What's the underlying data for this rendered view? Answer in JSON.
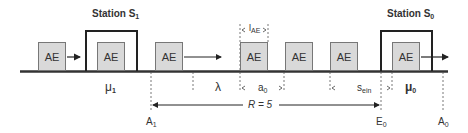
{
  "diagram": {
    "title_left_station": "Station S",
    "title_left_station_sub": "1",
    "title_right_station": "Station S",
    "title_right_station_sub": "0",
    "unit_label": "AE",
    "units": [
      {
        "id": "ae-1",
        "label": "AE",
        "note": "approaching station S1"
      },
      {
        "id": "ae-2",
        "label": "AE",
        "note": "inside station S1"
      },
      {
        "id": "ae-3",
        "label": "AE",
        "note": "departing station S1"
      },
      {
        "id": "ae-4",
        "label": "AE"
      },
      {
        "id": "ae-5",
        "label": "AE"
      },
      {
        "id": "ae-6",
        "label": "AE"
      },
      {
        "id": "ae-7",
        "label": "AE",
        "note": "inside station S0"
      }
    ],
    "labels": {
      "mu1": "μ",
      "mu1_sub": "1",
      "lambda": "λ",
      "l_ae": "l",
      "l_ae_sub": "AE",
      "a0": "a",
      "a0_sub": "0",
      "s_ein": "s",
      "s_ein_sub": "ein",
      "mu0": "μ",
      "mu0_sub": "0",
      "r_label": "R = 5",
      "a1": "A",
      "a1_sub": "1",
      "e0": "E",
      "e0_sub": "0",
      "a0_point": "A",
      "a0_point_sub": "0"
    },
    "colors": {
      "unit_fill": "#d9d9d9",
      "unit_border": "#777777",
      "track": "#333333",
      "station_frame": "#222222"
    }
  }
}
